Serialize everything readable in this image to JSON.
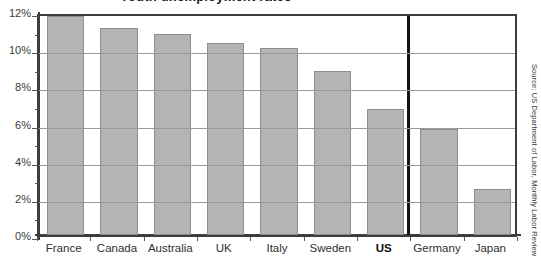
{
  "chart_data": {
    "type": "bar",
    "title": "Youth unemployment rates",
    "categories": [
      "France",
      "Canada",
      "Australia",
      "UK",
      "Italy",
      "Sweden",
      "US",
      "Germany",
      "Japan"
    ],
    "values": [
      11.8,
      11.15,
      10.8,
      10.35,
      10.05,
      8.85,
      6.8,
      5.7,
      2.5
    ],
    "highlight_category": "US",
    "xlabel": "",
    "ylabel": "",
    "ylim": [
      0,
      12
    ],
    "ytick_labels": [
      "0%",
      "2%",
      "4%",
      "6%",
      "8%",
      "10%",
      "12%"
    ],
    "ytick_values": [
      0,
      2,
      4,
      6,
      8,
      10,
      12
    ],
    "minor_tick_values": [
      1,
      3,
      5,
      7,
      9,
      11
    ],
    "grid": true,
    "legend": "none",
    "bar_color": "#b4b4b4",
    "bar_border_color": "#8d8d8d",
    "axis_color": "#3d3d3d",
    "grid_color": "#9a9a9a",
    "divider_after": "US",
    "source": "Source: US Department of Labor, Monthly Labor Review"
  }
}
